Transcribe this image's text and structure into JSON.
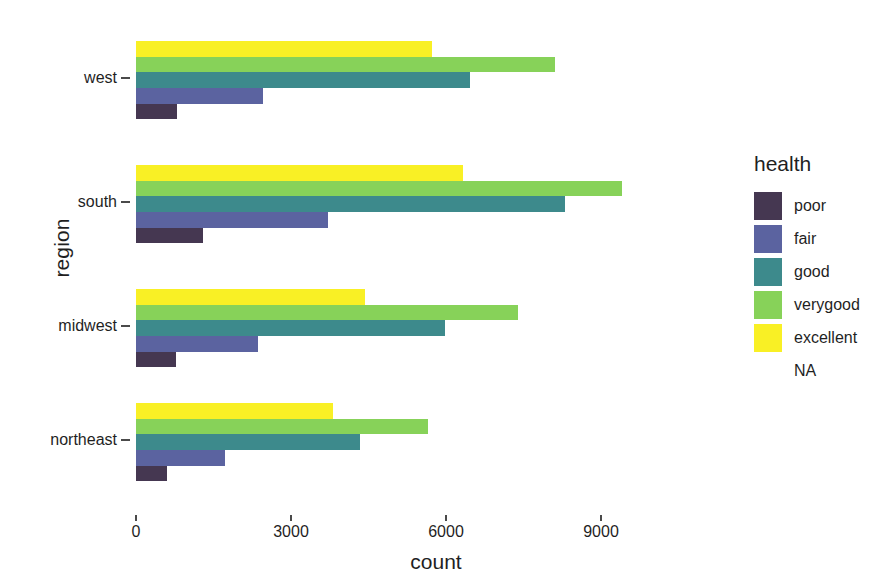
{
  "chart_data": {
    "type": "bar",
    "orientation": "horizontal",
    "grouped": true,
    "title": "",
    "xlabel": "count",
    "ylabel": "region",
    "categories": [
      "west",
      "south",
      "midwest",
      "northeast"
    ],
    "xlim": [
      0,
      11000
    ],
    "xticks": [
      0,
      3000,
      6000,
      9000
    ],
    "xtick_labels": [
      "0",
      "3000",
      "6000",
      "9000"
    ],
    "grid": false,
    "legend_title": "health",
    "legend_position": "right",
    "series": [
      {
        "name": "poor",
        "color": "#453751",
        "values": [
          793,
          1300,
          775,
          600
        ]
      },
      {
        "name": "fair",
        "color": "#5b63a0",
        "values": [
          2460,
          3720,
          2360,
          1720
        ]
      },
      {
        "name": "good",
        "color": "#3d8a8c",
        "values": [
          6465,
          8300,
          5980,
          4335
        ]
      },
      {
        "name": "verygood",
        "color": "#87d259",
        "values": [
          8110,
          9400,
          7395,
          5650
        ]
      },
      {
        "name": "excellent",
        "color": "#f9f025",
        "values": [
          5730,
          6330,
          4430,
          3815
        ]
      },
      {
        "name": "NA",
        "color": "#ffffff",
        "values": [
          0,
          0,
          0,
          0
        ]
      }
    ]
  },
  "axes": {
    "y_title": "region",
    "x_title": "count",
    "y_tick_labels": [
      "west",
      "south",
      "midwest",
      "northeast"
    ],
    "x_tick_labels": [
      "0",
      "3000",
      "6000",
      "9000"
    ]
  },
  "legend": {
    "title": "health",
    "items": [
      {
        "label": "poor",
        "color": "#453751"
      },
      {
        "label": "fair",
        "color": "#5b63a0"
      },
      {
        "label": "good",
        "color": "#3d8a8c"
      },
      {
        "label": "verygood",
        "color": "#87d259"
      },
      {
        "label": "excellent",
        "color": "#f9f025"
      },
      {
        "label": "NA",
        "color": ""
      }
    ]
  }
}
